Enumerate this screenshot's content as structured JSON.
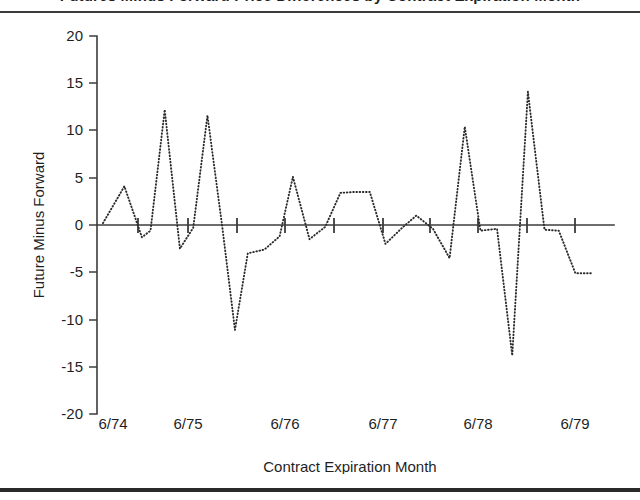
{
  "figure": {
    "title": "Futures Minus Forward Price Differences by Contract Expiration Month",
    "title_visible_fragment": "(title cropped at top edge)"
  },
  "chart_data": {
    "type": "line",
    "title": "",
    "xlabel": "Contract Expiration Month",
    "ylabel": "Future Minus Forward",
    "ylim": [
      -20,
      20
    ],
    "yticks": [
      20,
      15,
      10,
      5,
      0,
      -5,
      -10,
      -15,
      -20
    ],
    "ytick_labels": [
      "20",
      "15",
      "10",
      "5",
      "0",
      "-5",
      "-10",
      "-15",
      "-20"
    ],
    "xlim": [
      "6/74",
      "6/79"
    ],
    "xticks": [
      "6/74",
      "6/75",
      "6/76",
      "6/77",
      "6/78",
      "6/79"
    ],
    "xtick_labels": [
      "6/74",
      "6/75",
      "6/76",
      "6/77",
      "6/78",
      "6/79"
    ],
    "grid": false,
    "legend": "none",
    "line_style": "dotted",
    "zero_reference_line": true,
    "series": [
      {
        "name": "Future Minus Forward",
        "x": [
          0.0,
          0.45,
          0.82,
          1.0,
          1.3,
          1.62,
          1.9,
          2.2,
          2.52,
          2.78,
          3.05,
          3.4,
          3.72,
          4.0,
          4.35,
          4.68,
          5.0,
          5.3,
          5.62,
          5.95,
          6.3,
          6.6,
          6.95,
          7.3,
          7.62,
          7.95,
          8.3,
          8.62,
          8.95,
          9.3,
          9.6,
          9.95,
          10.3
        ],
        "values": [
          0.2,
          4.1,
          -1.3,
          -0.6,
          12.2,
          -2.5,
          -0.3,
          11.6,
          -0.5,
          -11.1,
          -3.0,
          -2.6,
          -1.2,
          5.1,
          -1.5,
          -0.2,
          3.4,
          3.5,
          3.5,
          -2.0,
          -0.3,
          1.0,
          -0.4,
          -3.5,
          10.4,
          -0.6,
          -0.4,
          -13.8,
          14.1,
          -0.5,
          -0.6,
          -5.1,
          -5.1
        ]
      }
    ]
  },
  "axes": {
    "y_axis_label": "Future Minus Forward",
    "x_axis_label": "Contract Expiration Month"
  }
}
